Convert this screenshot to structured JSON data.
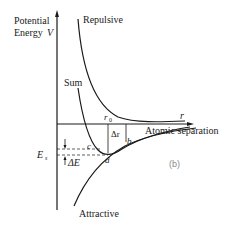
{
  "diagram": {
    "y_axis_label_line1": "Potential",
    "y_axis_label_line2": "Energy",
    "y_axis_symbol": "V",
    "x_axis_symbol": "r",
    "x_axis_label": "Atomic separation",
    "curves": {
      "repulsive": "Repulsive",
      "sum": "Sum",
      "attractive": "Attractive"
    },
    "labels": {
      "r0": "r",
      "r0_sub": "0",
      "delta_r": "Δr",
      "point_b": "b",
      "point_c": "c",
      "point_d": "d",
      "energy_level": "E",
      "energy_level_sub": "s",
      "delta_e": "ΔE",
      "panel": "(b)"
    },
    "colors": {
      "ink": "#1a1a1a",
      "panel_label": "#8a8a8a",
      "background": "#ffffff"
    }
  }
}
